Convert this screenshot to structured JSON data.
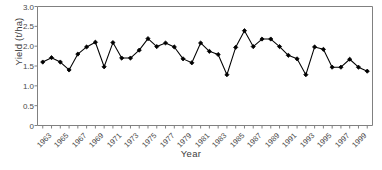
{
  "chart_data": {
    "type": "line",
    "title": "",
    "xlabel": "Year",
    "ylabel": "Yield (t/ha)",
    "xlim": [
      1962.4,
      2000.6
    ],
    "ylim": [
      0,
      3.0
    ],
    "yticks": [
      "0",
      "0.5",
      "1.0",
      "1.5",
      "2.0",
      "2.5",
      "3.0"
    ],
    "ytick_values": [
      0,
      0.5,
      1.0,
      1.5,
      2.0,
      2.5,
      3.0
    ],
    "xticks": [
      "1963",
      "1965",
      "1967",
      "1969",
      "1971",
      "1973",
      "1975",
      "1977",
      "1979",
      "1981",
      "1983",
      "1985",
      "1987",
      "1989",
      "1991",
      "1993",
      "1995",
      "1997",
      "1999"
    ],
    "xtick_values": [
      1963,
      1965,
      1967,
      1969,
      1971,
      1973,
      1975,
      1977,
      1979,
      1981,
      1983,
      1985,
      1987,
      1989,
      1991,
      1993,
      1995,
      1997,
      1999
    ],
    "grid": false,
    "legend": null,
    "marker": "filled-diamond",
    "line_color": "#000000",
    "marker_color": "#000000",
    "axis_color": "#808080",
    "x": [
      1963,
      1964,
      1965,
      1966,
      1967,
      1968,
      1969,
      1970,
      1971,
      1972,
      1973,
      1974,
      1975,
      1976,
      1977,
      1978,
      1979,
      1980,
      1981,
      1982,
      1983,
      1984,
      1985,
      1986,
      1987,
      1988,
      1989,
      1990,
      1991,
      1992,
      1993,
      1994,
      1995,
      1996,
      1997,
      1998,
      1999,
      2000
    ],
    "values": [
      1.6,
      1.71,
      1.6,
      1.4,
      1.8,
      1.98,
      2.1,
      1.48,
      2.09,
      1.7,
      1.7,
      1.9,
      2.19,
      1.99,
      2.08,
      1.98,
      1.68,
      1.58,
      2.08,
      1.87,
      1.79,
      1.28,
      1.97,
      2.39,
      1.99,
      2.18,
      2.18,
      1.99,
      1.77,
      1.68,
      1.28,
      1.98,
      1.92,
      1.47,
      1.47,
      1.67,
      1.47,
      1.37
    ],
    "series": [
      {
        "name": "Yield",
        "values": [
          1.6,
          1.71,
          1.6,
          1.4,
          1.8,
          1.98,
          2.1,
          1.48,
          2.09,
          1.7,
          1.7,
          1.9,
          2.19,
          1.99,
          2.08,
          1.98,
          1.68,
          1.58,
          2.08,
          1.87,
          1.79,
          1.28,
          1.97,
          2.39,
          1.99,
          2.18,
          2.18,
          1.99,
          1.77,
          1.68,
          1.28,
          1.98,
          1.92,
          1.47,
          1.47,
          1.67,
          1.47,
          1.37
        ]
      }
    ]
  }
}
